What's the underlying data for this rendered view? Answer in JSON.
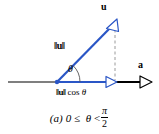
{
  "figure": {
    "label": "vector-projection-diagram",
    "colors": {
      "vector_u": "#2a56c6",
      "vector_a": "#000000",
      "axis": "#000000",
      "dashed_guide": "#9a9a9a",
      "background": "#ffffff"
    },
    "labels": {
      "vector_u_name": "u",
      "vector_a_name": "a",
      "magnitude_u_bars_left": "‖",
      "magnitude_u_letter": "u",
      "magnitude_u_bars_right": "‖",
      "magnitude_u": "‖u‖",
      "angle_symbol": "θ",
      "projection_bars_left": "‖",
      "projection_letter": "u",
      "projection_bars_right": "‖",
      "projection_cos": "cos",
      "projection_theta": "θ",
      "projection_full": "‖u‖ cos θ"
    },
    "caption": {
      "tag": "(a)",
      "lower_bound": "0",
      "relation_left": "≤",
      "variable": "θ",
      "relation_right": "<",
      "fraction_numerator": "π",
      "fraction_denominator": "2",
      "full_text": "(a) 0 ≤ θ < π/2"
    },
    "geometry": {
      "origin_x": 57,
      "origin_y": 82,
      "u_tip_x": 115,
      "u_tip_y": 22,
      "axis_start_x": 8,
      "axis_end_x": 152,
      "projection_x": 115,
      "angle_degrees": 46
    }
  }
}
